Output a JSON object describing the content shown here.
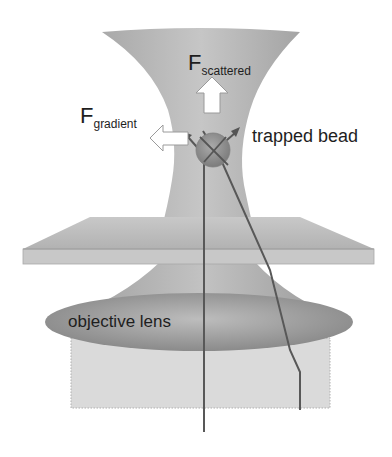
{
  "diagram": {
    "labels": {
      "f_scattered_main": "F",
      "f_scattered_sub": "scattered",
      "f_gradient_main": "F",
      "f_gradient_sub": "gradient",
      "trapped_bead": "trapped bead",
      "objective_lens": "objective lens"
    },
    "colors": {
      "beam": "#b4b4b4",
      "beam_dark": "#9a9a9a",
      "slide": "#bdbdbd",
      "lens": "#8f8f8f",
      "box": "#d9d9d9",
      "ray": "#5a5a5a",
      "bead": "#8a8a8a",
      "arrow_fill": "#ffffff",
      "text": "#1e1e1e"
    }
  }
}
